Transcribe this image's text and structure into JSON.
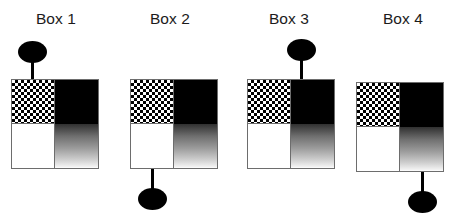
{
  "figure": {
    "title": "",
    "background_color": "#ffffff",
    "box_count": 4
  },
  "palette": {
    "ink": "#000000",
    "label_text": "#1b1b1b",
    "box_border": "#6d6d6d",
    "white_fill": "#ffffff",
    "black_fill": "#000000",
    "gradient_top": "#303030",
    "gradient_bottom": "#ffffff"
  },
  "quadrant_names": {
    "top_left": "checkered",
    "top_right": "black",
    "bottom_left": "white",
    "bottom_right": "gradient"
  },
  "boxes": [
    {
      "label": "Box 1",
      "connector_side": "top",
      "connector_quadrant": "top-left",
      "connector_fill": "checkered",
      "marker": "filled-ellipse",
      "quadrants": {
        "top_left": "checkered",
        "top_right": "black",
        "bottom_left": "white",
        "bottom_right": "gradient"
      }
    },
    {
      "label": "Box 2",
      "connector_side": "bottom",
      "connector_quadrant": "bottom-left",
      "connector_fill": "white",
      "marker": "filled-ellipse",
      "quadrants": {
        "top_left": "checkered",
        "top_right": "black",
        "bottom_left": "white",
        "bottom_right": "gradient"
      }
    },
    {
      "label": "Box 3",
      "connector_side": "top",
      "connector_quadrant": "top-right",
      "connector_fill": "black",
      "marker": "filled-ellipse",
      "quadrants": {
        "top_left": "checkered",
        "top_right": "black",
        "bottom_left": "white",
        "bottom_right": "gradient"
      }
    },
    {
      "label": "Box 4",
      "connector_side": "bottom",
      "connector_quadrant": "bottom-right",
      "connector_fill": "gradient",
      "marker": "filled-ellipse",
      "quadrants": {
        "top_left": "checkered",
        "top_right": "black",
        "bottom_left": "white",
        "bottom_right": "gradient"
      }
    }
  ]
}
